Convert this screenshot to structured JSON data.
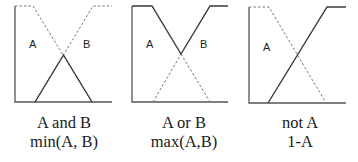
{
  "panels": [
    {
      "id": "and",
      "set_labels": [
        "A",
        "B"
      ],
      "caption": {
        "line1": "A and B",
        "line2": "min(A, B)"
      }
    },
    {
      "id": "or",
      "set_labels": [
        "A",
        "B"
      ],
      "caption": {
        "line1": "A or B",
        "line2": "max(A,B)"
      }
    },
    {
      "id": "not",
      "set_labels": [
        "A"
      ],
      "caption": {
        "line1": "not A",
        "line2": "1-A"
      }
    }
  ],
  "colors": {
    "solid_line": "#3a3a3a",
    "dashed_line": "#6a6a6a",
    "axis": "#555555"
  }
}
